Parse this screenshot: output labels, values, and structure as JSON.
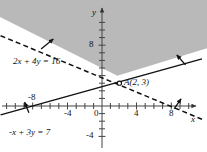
{
  "figure": {
    "width": 207,
    "height": 152,
    "background": "#ffffff",
    "shade_color": "#b9b9b9",
    "line_color": "#111111",
    "axis_color": "#444444"
  },
  "axes": {
    "x_name": "x",
    "y_name": "y",
    "origin_label": "0",
    "x_ticks": [
      {
        "value": -8,
        "label": "-8",
        "show_label": true
      },
      {
        "value": -4,
        "label": "-4",
        "show_label": true
      },
      {
        "value": 0,
        "label": "0",
        "show_label": true
      },
      {
        "value": 4,
        "label": "4",
        "show_label": true
      },
      {
        "value": 8,
        "label": "8",
        "show_label": true
      }
    ],
    "y_ticks": [
      {
        "value": 8,
        "label": "8",
        "show_label": true
      },
      {
        "value": 4,
        "label": "4",
        "show_label": false
      },
      {
        "value": -4,
        "label": "-4",
        "show_label": true
      }
    ],
    "x_range": [
      -10.5,
      11.5
    ],
    "y_range": [
      -5.5,
      11.5
    ],
    "tick_step": 1
  },
  "lines": [
    {
      "id": "dashed-line",
      "equation_label": "2x + 4y = 16",
      "style": "dashed",
      "slope": -0.5,
      "intercept": 4,
      "endpoints_math": [
        [
          -10.5,
          9.25
        ],
        [
          11.5,
          -1.75
        ]
      ],
      "x_intercept": 8,
      "y_intercept": 4
    },
    {
      "id": "solid-line",
      "equation_label": "-x + 3y = 7",
      "style": "solid",
      "slope": 0.3333,
      "intercept": 2.3333,
      "endpoints_math": [
        [
          -10.5,
          -1.167
        ],
        [
          11.5,
          6.167
        ]
      ],
      "x_intercept": -7,
      "y_intercept": 2.333
    }
  ],
  "point": {
    "label": "A(2, 3)",
    "label_text_A": "A",
    "label_text_coords": "(2, 3)",
    "x": 2,
    "y": 3,
    "marker": "open-circle"
  },
  "arrows": [
    {
      "id": "arrow-dashed-upper-left",
      "from_math": [
        -7.0,
        7.5
      ],
      "to_math": [
        -5.6,
        8.8
      ],
      "note": "points into shaded side of dashed line"
    },
    {
      "id": "arrow-solid-upper-right",
      "from_math": [
        9.6,
        5.4
      ],
      "to_math": [
        8.6,
        6.7
      ],
      "note": "points into shaded side of solid line"
    },
    {
      "id": "arrow-solid-lower-left",
      "from_math": [
        -8.4,
        -0.9
      ],
      "to_math": [
        -8.9,
        0.5
      ],
      "note": "points up from solid line near x=-8"
    },
    {
      "id": "arrow-dashed-lower-right",
      "from_math": [
        8.3,
        -0.35
      ],
      "to_math": [
        9.1,
        0.95
      ],
      "note": "points up-right from dashed line near x=8"
    }
  ],
  "shaded_region": {
    "description": "Region above the dashed line 2x+4y=16 and above the solid line -x+3y=7",
    "fill": "#b9b9b9",
    "opacity": 1
  }
}
